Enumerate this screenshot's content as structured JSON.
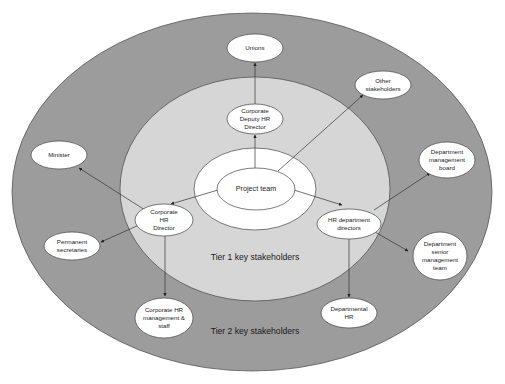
{
  "diagram": {
    "type": "stakeholder concentric map",
    "colors": {
      "background": "#ffffff",
      "tier2_fill": "#9c9c9c",
      "tier1_fill": "#d6d6d6",
      "node_fill": "#ffffff",
      "stroke": "#333333"
    },
    "tiers": [
      {
        "id": "tier1",
        "label": "Tier 1 key stakeholders"
      },
      {
        "id": "tier2",
        "label": "Tier 2 key stakeholders"
      }
    ],
    "center": {
      "label": "Project team"
    },
    "nodes": {
      "unions": {
        "label": "Unions"
      },
      "corporate_deputy_hr_director": {
        "label": "Corporate\nDeputy HR\nDirector"
      },
      "other_stakeholders": {
        "label": "Other\nstakeholders"
      },
      "minister": {
        "label": "Minister"
      },
      "department_management_board": {
        "label": "Department\nmanagement\nboard"
      },
      "corporate_hr_director": {
        "label": "Corporate\nHR\nDirector"
      },
      "hr_department_directors": {
        "label": "HR department\ndirectors"
      },
      "permanent_secretaries": {
        "label": "Permanent\nsecretaries"
      },
      "department_senior_management_team": {
        "label": "Department\nsenior\nmanagement\nteam"
      },
      "departmental_hr": {
        "label": "Departmental\nHR"
      },
      "corporate_hr_management_staff": {
        "label": "Corporate HR\nmanagement &\nstaff"
      }
    },
    "edges": [
      {
        "from": "Project team",
        "to": "Corporate Deputy HR Director"
      },
      {
        "from": "Corporate Deputy HR Director",
        "to": "Unions"
      },
      {
        "from": "Project team",
        "to": "Other stakeholders"
      },
      {
        "from": "Project team",
        "to": "Corporate HR Director"
      },
      {
        "from": "Project team",
        "to": "HR department directors"
      },
      {
        "from": "Corporate HR Director",
        "to": "Minister"
      },
      {
        "from": "Corporate HR Director",
        "to": "Permanent secretaries"
      },
      {
        "from": "Corporate HR Director",
        "to": "Corporate HR management & staff"
      },
      {
        "from": "HR department directors",
        "to": "Department management board"
      },
      {
        "from": "HR department directors",
        "to": "Department senior management team"
      },
      {
        "from": "HR department directors",
        "to": "Departmental HR"
      }
    ]
  }
}
